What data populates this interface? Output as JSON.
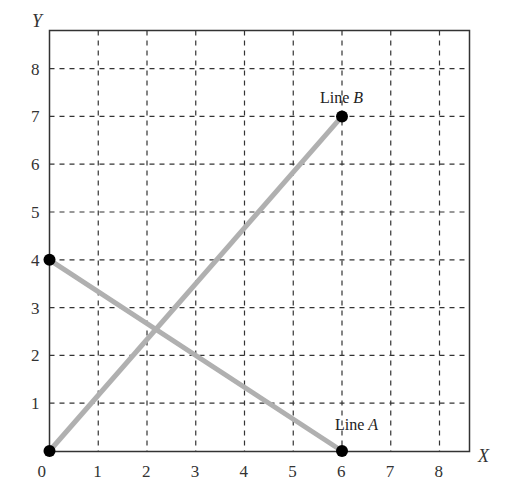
{
  "chart_data": {
    "type": "line",
    "title": "",
    "xlabel": "X",
    "ylabel": "Y",
    "xlim": [
      0,
      8.6
    ],
    "ylim": [
      0,
      8.8
    ],
    "grid": true,
    "grid_style": "dashed",
    "x_ticks": [
      "0",
      "1",
      "2",
      "3",
      "4",
      "5",
      "6",
      "7",
      "8"
    ],
    "y_ticks": [
      "1",
      "2",
      "3",
      "4",
      "5",
      "6",
      "7",
      "8"
    ],
    "series": [
      {
        "name": "Line A",
        "label_name": "Line",
        "label_letter": "A",
        "color": "#b0b0b0",
        "points": [
          [
            0,
            4
          ],
          [
            6,
            0
          ]
        ],
        "endpoint_markers": [
          [
            0,
            4
          ],
          [
            6,
            0
          ]
        ]
      },
      {
        "name": "Line B",
        "label_name": "Line",
        "label_letter": "B",
        "color": "#b0b0b0",
        "points": [
          [
            0,
            0
          ],
          [
            6,
            7
          ]
        ],
        "endpoint_markers": [
          [
            0,
            0
          ],
          [
            6,
            7
          ]
        ]
      }
    ],
    "intersection": [
      2.2,
      2.6
    ]
  },
  "labels": {
    "x_axis": "X",
    "y_axis": "Y",
    "line_a_word": "Line",
    "line_a_letter": "A",
    "line_b_word": "Line",
    "line_b_letter": "B",
    "origin": "0"
  },
  "colors": {
    "frame": "#333333",
    "grid": "#333333",
    "line": "#b0b0b0",
    "marker": "#000000"
  }
}
